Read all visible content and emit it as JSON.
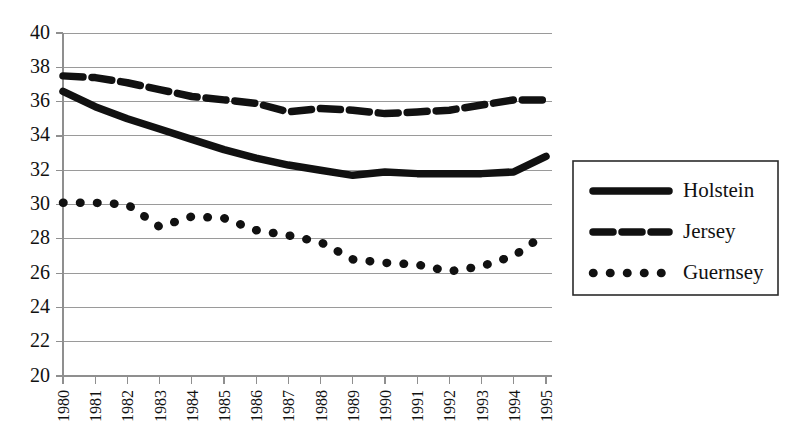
{
  "chart_data": {
    "type": "line",
    "title": "",
    "subtitle": "",
    "xlabel": "",
    "ylabel": "",
    "x": [
      1980,
      1981,
      1982,
      1983,
      1984,
      1985,
      1986,
      1987,
      1988,
      1989,
      1990,
      1991,
      1992,
      1993,
      1994,
      1995
    ],
    "categories": [
      "1980",
      "1981",
      "1982",
      "1983",
      "1984",
      "1985",
      "1986",
      "1987",
      "1988",
      "1989",
      "1990",
      "1991",
      "1992",
      "1993",
      "1994",
      "1995"
    ],
    "xlim": [
      1980,
      1995
    ],
    "ylim": [
      20,
      40
    ],
    "yticks": [
      20,
      22,
      24,
      26,
      28,
      30,
      32,
      34,
      36,
      38,
      40
    ],
    "ytick_labels": [
      "20",
      "22",
      "24",
      "26",
      "28",
      "30",
      "32",
      "34",
      "36",
      "38",
      "40"
    ],
    "grid": "horizontal",
    "legend_position": "right",
    "series": [
      {
        "name": "Holstein",
        "style": "solid",
        "color": "#111111",
        "values": [
          36.6,
          35.7,
          35.0,
          34.4,
          33.8,
          33.2,
          32.7,
          32.3,
          32.0,
          31.7,
          31.9,
          31.8,
          31.8,
          31.8,
          31.9,
          32.8
        ]
      },
      {
        "name": "Jersey",
        "style": "dashed",
        "color": "#111111",
        "values": [
          37.5,
          37.4,
          37.1,
          36.7,
          36.3,
          36.1,
          35.9,
          35.4,
          35.6,
          35.5,
          35.3,
          35.4,
          35.5,
          35.8,
          36.1,
          36.1
        ]
      },
      {
        "name": "Guernsey",
        "style": "dotted",
        "color": "#111111",
        "values": [
          30.1,
          30.1,
          30.0,
          28.7,
          29.3,
          29.2,
          28.5,
          28.2,
          27.8,
          26.8,
          26.6,
          26.5,
          26.1,
          26.4,
          27.0,
          28.3
        ]
      }
    ],
    "legend": [
      {
        "label": "Holstein",
        "style": "solid"
      },
      {
        "label": "Jersey",
        "style": "dashed"
      },
      {
        "label": "Guernsey",
        "style": "dotted"
      }
    ]
  }
}
